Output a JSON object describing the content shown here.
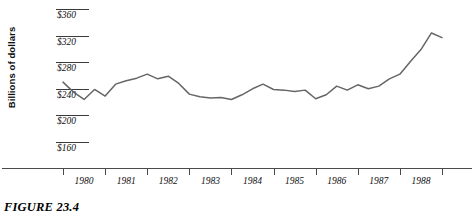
{
  "figure": {
    "caption": "FIGURE 23.4"
  },
  "chart_data": {
    "type": "line",
    "title": "",
    "xlabel": "",
    "ylabel": "Billions of dollars",
    "ylim": [
      160,
      360
    ],
    "yticks": [
      360,
      320,
      280,
      240,
      200,
      160
    ],
    "ytick_labels": [
      "$360",
      "$320",
      "$280",
      "$240",
      "$200",
      "$160"
    ],
    "xlim": [
      1980,
      1989
    ],
    "xtick_labels": [
      "1980",
      "1981",
      "1982",
      "1983",
      "1984",
      "1985",
      "1986",
      "1987",
      "1988"
    ],
    "grid": "y-stubs-only",
    "legend": "none",
    "line_color": "#666666",
    "axis_color": "#4a4a4a",
    "series": [
      {
        "name": "value",
        "x": [
          1980.0,
          1980.25,
          1980.5,
          1980.75,
          1981.0,
          1981.25,
          1981.5,
          1981.75,
          1982.0,
          1982.25,
          1982.5,
          1982.75,
          1983.0,
          1983.25,
          1983.5,
          1983.75,
          1984.0,
          1984.25,
          1984.5,
          1984.75,
          1985.0,
          1985.25,
          1985.5,
          1985.75,
          1986.0,
          1986.25,
          1986.5,
          1986.75,
          1987.0,
          1987.25,
          1987.5,
          1987.75,
          1988.0,
          1988.25,
          1988.5,
          1988.75
        ],
        "values": [
          250,
          235,
          224,
          239,
          229,
          247,
          252,
          256,
          262,
          255,
          259,
          248,
          232,
          228,
          226,
          227,
          224,
          231,
          240,
          247,
          239,
          238,
          236,
          238,
          225,
          231,
          244,
          238,
          246,
          240,
          244,
          255,
          262,
          281,
          299,
          324
        ],
        "last_value": 317
      }
    ]
  }
}
